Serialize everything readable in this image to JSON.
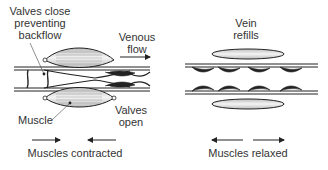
{
  "diagram": {
    "panels": [
      {
        "id": "contracted",
        "caption": "Muscles contracted",
        "labels": {
          "valves_close": [
            "Valves close",
            "preventing",
            "backflow"
          ],
          "venous_flow": [
            "Venous",
            "flow"
          ],
          "muscle": "Muscle",
          "valves_open": [
            "Valves",
            "open"
          ]
        },
        "arrows": "inward"
      },
      {
        "id": "relaxed",
        "caption": "Muscles relaxed",
        "labels": {
          "vein_refills": [
            "Vein",
            "refills"
          ]
        },
        "arrows": "outward"
      }
    ],
    "colors": {
      "line": "#222222",
      "muscle_fill": "#d0d0d0",
      "muscle_highlight": "#f2f2f2",
      "text": "#333333"
    }
  }
}
